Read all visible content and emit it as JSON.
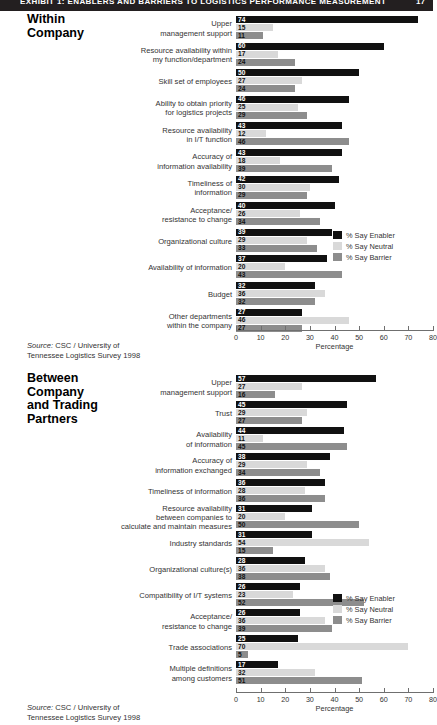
{
  "header": {
    "title": "EXHIBIT 1:  ENABLERS AND BARRIERS TO LOGISTICS PERFORMANCE MEASUREMENT",
    "page": "17"
  },
  "legend": {
    "items": [
      {
        "label": "% Say Enabler",
        "color": "#111111"
      },
      {
        "label": "% Say Neutral",
        "color": "#d9d9d9"
      },
      {
        "label": "% Say Barrier",
        "color": "#8d8d8d"
      }
    ]
  },
  "axis": {
    "xlabel": "Percentage",
    "ticks": [
      "0",
      "10",
      "20",
      "30",
      "40",
      "50",
      "60",
      "70",
      "80"
    ],
    "min": 0,
    "max": 80
  },
  "source": {
    "prefix": "Source:",
    "text": " CSC / University of",
    "line2": "Tennessee Logistics Survey 1998"
  },
  "chart_data": [
    {
      "type": "bar",
      "title": "Within Company",
      "orientation": "horizontal",
      "xlabel": "Percentage",
      "ylabel": "",
      "xlim": [
        0,
        80
      ],
      "grid": false,
      "legend_position": "right-middle",
      "series": [
        {
          "name": "% Say Enabler",
          "color": "#111111",
          "values": [
            74,
            60,
            50,
            46,
            43,
            43,
            42,
            40,
            39,
            37,
            32,
            27
          ]
        },
        {
          "name": "% Say Neutral",
          "color": "#d9d9d9",
          "values": [
            15,
            17,
            27,
            25,
            12,
            18,
            30,
            26,
            29,
            20,
            36,
            46
          ]
        },
        {
          "name": "% Say Barrier",
          "color": "#8d8d8d",
          "values": [
            11,
            24,
            24,
            29,
            46,
            39,
            29,
            34,
            33,
            43,
            32,
            27
          ]
        }
      ],
      "categories": [
        "Upper\nmanagement support",
        "Resource availability within\nmy function/department",
        "Skill set of employees",
        "Ability to obtain priority\nfor logistics projects",
        "Resource availability\nin I/T function",
        "Accuracy of\ninformation availability",
        "Timeliness of\ninformation",
        "Acceptance/\nresistance to change",
        "Organizational culture",
        "Availability of information",
        "Budget",
        "Other departments\nwithin the company"
      ]
    },
    {
      "type": "bar",
      "title": "Between\nCompany\nand Trading\nPartners",
      "orientation": "horizontal",
      "xlabel": "Percentage",
      "ylabel": "",
      "xlim": [
        0,
        80
      ],
      "grid": false,
      "legend_position": "right-middle",
      "series": [
        {
          "name": "% Say Enabler",
          "color": "#111111",
          "values": [
            57,
            45,
            44,
            38,
            36,
            31,
            31,
            28,
            26,
            26,
            25,
            17
          ]
        },
        {
          "name": "% Say Neutral",
          "color": "#d9d9d9",
          "values": [
            27,
            29,
            11,
            29,
            28,
            20,
            54,
            36,
            23,
            36,
            70,
            32
          ]
        },
        {
          "name": "% Say Barrier",
          "color": "#8d8d8d",
          "values": [
            16,
            27,
            45,
            34,
            36,
            50,
            15,
            38,
            52,
            39,
            5,
            51
          ]
        }
      ],
      "categories": [
        "Upper\nmanagement support",
        "Trust",
        "Availability\nof information",
        "Accuracy of\ninformation exchanged",
        "Timeliness of information",
        "Resource availability\nbetween companies to\ncalculate and maintain measures",
        "Industry standards",
        "Organizational culture(s)",
        "Compatibility of I/T systems",
        "Acceptance/\nresistance to change",
        "Trade associations",
        "Multiple definitions\namong customers"
      ]
    }
  ]
}
